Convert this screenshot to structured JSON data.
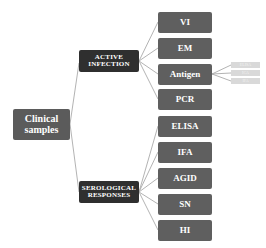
{
  "diagram": {
    "root": {
      "label_line1": "Clinical",
      "label_line2": "samples"
    },
    "branches": [
      {
        "label_line1": "ACTIVE",
        "label_line2": "INFECTION",
        "children": [
          "VI",
          "EM",
          "Antigen",
          "PCR"
        ],
        "antigen_subitems": [
          "ELISA",
          "ICA",
          "IFA"
        ]
      },
      {
        "label_line1": "SEROLOGICAL",
        "label_line2": "RESPONSES",
        "children": [
          "ELISA",
          "IFA",
          "AGID",
          "SN",
          "HI"
        ]
      }
    ],
    "colors": {
      "root": "#5b5b5b",
      "branch": "#2f2f2f",
      "leaf": "#5f5f5f",
      "subitem": "#d9d9d9",
      "line": "#9a9a9a"
    }
  }
}
